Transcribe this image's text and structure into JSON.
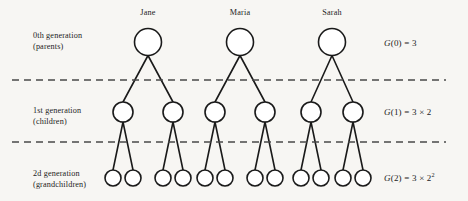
{
  "figure": {
    "background_color": "#f7f6f3",
    "stroke_color": "#1a1a1a",
    "dash_color": "#4a4a4a",
    "width": 468,
    "height": 201
  },
  "rows": [
    {
      "id": "generation-0",
      "label_line1": "0th generation",
      "label_line2": "(parents)",
      "label_x": 33,
      "label_y": 30,
      "node_count": 3,
      "node_radius": 13.5,
      "node_y": 42,
      "formula": {
        "function": "G",
        "argument": "0",
        "equals": "=",
        "expression": "3",
        "base": "",
        "exponent": "",
        "x": 384,
        "y": 38
      }
    },
    {
      "id": "generation-1",
      "label_line1": "1st generation",
      "label_line2": "(children)",
      "label_x": 33,
      "label_y": 105,
      "node_count": 6,
      "node_radius": 10,
      "node_y": 112,
      "formula": {
        "function": "G",
        "argument": "1",
        "equals": "=",
        "expression": "3 × 2",
        "base": "",
        "exponent": "",
        "x": 384,
        "y": 107
      }
    },
    {
      "id": "generation-2",
      "label_line1": "2d generation",
      "label_line2": "(grandchildren)",
      "label_x": 33,
      "label_y": 168,
      "node_count": 12,
      "node_radius": 8,
      "node_y": 178,
      "formula": {
        "function": "G",
        "argument": "2",
        "equals": "=",
        "expression": "3 × 2",
        "base": "2",
        "exponent": "2",
        "x": 384,
        "y": 173
      }
    }
  ],
  "families": [
    {
      "name": "Jane",
      "name_x": 148,
      "name_y": 8,
      "parent_x": 148,
      "children_x": [
        123,
        173
      ],
      "grandchildren_x": [
        113,
        133,
        163,
        183
      ]
    },
    {
      "name": "Maria",
      "name_x": 240,
      "name_y": 8,
      "parent_x": 240,
      "children_x": [
        215,
        265
      ],
      "grandchildren_x": [
        205,
        225,
        255,
        275
      ]
    },
    {
      "name": "Sarah",
      "name_x": 332,
      "name_y": 8,
      "parent_x": 332,
      "children_x": [
        311,
        353
      ],
      "grandchildren_x": [
        301,
        321,
        343,
        363
      ]
    }
  ],
  "dividers": [
    {
      "id": "divider-gen0-gen1",
      "y": 80,
      "x_start": 12,
      "x_end": 446
    },
    {
      "id": "divider-gen1-gen2",
      "y": 142,
      "x_start": 12,
      "x_end": 446
    }
  ]
}
